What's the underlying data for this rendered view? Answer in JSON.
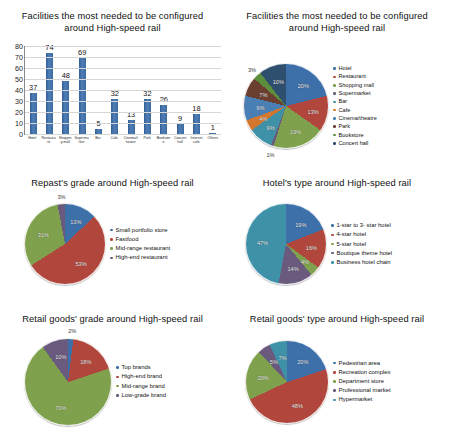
{
  "palette": {
    "c1": "#3d6fa8",
    "c2": "#b1473c",
    "c3": "#7fa04c",
    "c4": "#6a5a7e",
    "c5": "#3f91a8",
    "c6": "#d3772f",
    "c7": "#4a7fb5",
    "c8": "#6b3f2f",
    "c9": "#5c8f3c",
    "c10": "#2f4f6e",
    "c11": "#8f5f2f",
    "c12": "#b8b8b8"
  },
  "charts": [
    {
      "id": "facilities-bar",
      "title": "Facilities the most needed to be configured around High-speed rail",
      "chart_data": {
        "type": "bar",
        "title": "Facilities the most needed to be configured around High-speed rail",
        "xlabel": "",
        "ylabel": "",
        "ylim": [
          0,
          80
        ],
        "yticks": [
          0,
          10,
          20,
          30,
          40,
          50,
          60,
          70,
          80
        ],
        "grid": true,
        "categories": [
          "Hotel",
          "Restaurant",
          "Shopping mall",
          "Supermarket",
          "Bar",
          "Cafe",
          "Cinema/theatre",
          "Park",
          "Bookstore",
          "Concert hall",
          "Internet cafe",
          "Others"
        ],
        "values": [
          37,
          74,
          48,
          69,
          5,
          32,
          13,
          32,
          26,
          9,
          18,
          1
        ]
      }
    },
    {
      "id": "facilities-pie",
      "title": "Facilities the most needed to be configured around High-speed rail",
      "chart_data": {
        "type": "pie",
        "title": "Facilities the most needed to be configured around High-speed rail",
        "legend_position": "right",
        "labels": [
          "Hotel",
          "Restaurant",
          "Shopping mall",
          "Supermarket",
          "Bar",
          "Cafe",
          "Cinema/theatre",
          "Park",
          "Bookstore",
          "Concert hall"
        ],
        "values": [
          20,
          13,
          19,
          1,
          9,
          4,
          9,
          7,
          3,
          10
        ],
        "display_labels": [
          "20%",
          "13%",
          "19%",
          "1%",
          "9%",
          "4%",
          "9%",
          "7%",
          "3%",
          "10%"
        ],
        "extra_label": "0%"
      }
    },
    {
      "id": "repast-grade-pie",
      "title": "Repast's grade around High-speed rail",
      "chart_data": {
        "type": "pie",
        "title": "Repast's grade around High-speed rail",
        "legend_position": "right",
        "labels": [
          "Small portfolio store",
          "Fastfood",
          "Mid-range restaurant",
          "High-end restaurant"
        ],
        "values": [
          13,
          53,
          31,
          3
        ],
        "display_labels": [
          "13%",
          "53%",
          "31%",
          "3%"
        ]
      }
    },
    {
      "id": "hotel-type-pie",
      "title": "Hotel's type around High-speed rail",
      "chart_data": {
        "type": "pie",
        "title": "Hotel's type around High-speed rail",
        "legend_position": "right",
        "labels": [
          "1-star to 3- star hotel",
          "4-star hotel",
          "5-star hotel",
          "Boutique theme hotel",
          "Business hotel chain"
        ],
        "values": [
          19,
          16,
          4,
          14,
          47
        ],
        "display_labels": [
          "19%",
          "16%",
          "4%",
          "14%",
          "47%"
        ]
      }
    },
    {
      "id": "retail-grade-pie",
      "title": "Retail goods' grade around High-speed rail",
      "chart_data": {
        "type": "pie",
        "title": "Retail goods' grade around High-speed rail",
        "legend_position": "right",
        "labels": [
          "Top brands",
          "High-end brand",
          "Mid-range brand",
          "Low-grade brand"
        ],
        "values": [
          2,
          18,
          70,
          10
        ],
        "display_labels": [
          "2%",
          "18%",
          "70%",
          "10%"
        ]
      }
    },
    {
      "id": "retail-type-pie",
      "title": "Retail goods' type around High-speed rail",
      "chart_data": {
        "type": "pie",
        "title": "Retail goods' type around High-speed rail",
        "legend_position": "right",
        "labels": [
          "Pedestrian area",
          "Recreation complex",
          "Department store",
          "Professional market",
          "Hypermarket"
        ],
        "values": [
          20,
          48,
          20,
          5,
          7
        ],
        "display_labels": [
          "20%",
          "48%",
          "20%",
          "5%",
          "7%"
        ]
      }
    }
  ]
}
